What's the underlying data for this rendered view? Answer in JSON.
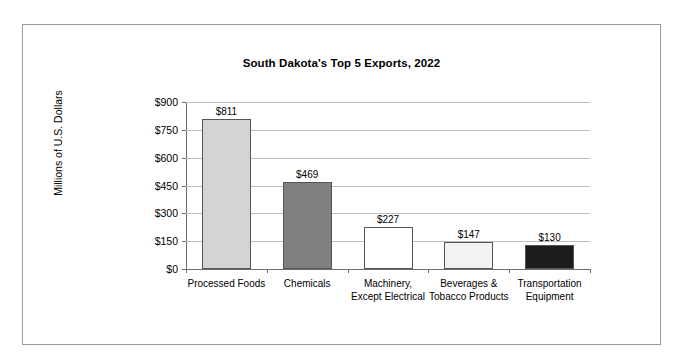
{
  "chart_data": {
    "type": "bar",
    "title": "South Dakota's Top 5 Exports, 2022",
    "xlabel": "",
    "ylabel": "Millions of U.S. Dollars",
    "categories": [
      "Processed Foods",
      "Chemicals",
      "Machinery, Except Electrical",
      "Beverages & Tobacco Products",
      "Transportation Equipment"
    ],
    "values": [
      811,
      469,
      227,
      147,
      130
    ],
    "value_labels": [
      "$811",
      "$469",
      "$227",
      "$147",
      "$130"
    ],
    "bar_colors": [
      "#d4d4d4",
      "#808080",
      "#ffffff",
      "#f2f2f2",
      "#1c1c1c"
    ],
    "bar_border_color": "#555555",
    "ylim": [
      0,
      900
    ],
    "yticks": [
      0,
      150,
      300,
      450,
      600,
      750,
      900
    ],
    "ytick_labels": [
      "$0",
      "$150",
      "$300",
      "$450",
      "$600",
      "$750",
      "$900"
    ],
    "grid": true,
    "legend": "none"
  },
  "figure": {
    "border_color": "#9a9a9a",
    "background": "#ffffff"
  }
}
